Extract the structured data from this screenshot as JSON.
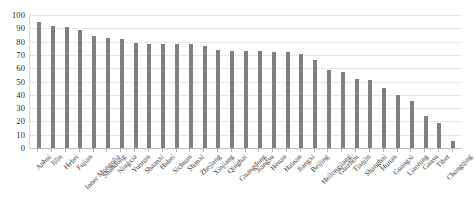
{
  "chart_data": {
    "type": "bar",
    "title": "",
    "subtitle": "",
    "xlabel": "",
    "ylabel": "",
    "ylim": [
      0,
      100
    ],
    "yticks": [
      100,
      90,
      80,
      70,
      60,
      50,
      40,
      30,
      20,
      10,
      0
    ],
    "grid": true,
    "legend": "none",
    "bar_color": "#808080",
    "gridline_color": "#e8e8e8",
    "axis_color": "#bfbfbf",
    "categories": [
      "Anhui",
      "Jilin",
      "Hebei",
      "Fujian",
      "Inner Mongolia",
      "Shandong",
      "Ningxia",
      "Yunnan",
      "Shaanxi",
      "Hubei",
      "Sichuan",
      "Shanxi",
      "Zhejiang",
      "Xinjiang",
      "Qinghai",
      "Guangdong",
      "Jiangsu",
      "Henan",
      "Hainan",
      "Jiangxi",
      "Beijing",
      "Heilongjiang",
      "Guizhou",
      "Tianjin",
      "Shanghai",
      "Hunan",
      "Guangxi",
      "Liaoning",
      "Gansu",
      "Tibet",
      "Chongqing"
    ],
    "values": [
      95,
      92,
      91,
      89,
      84,
      83,
      82,
      79,
      78,
      78,
      78,
      78,
      77,
      74,
      73,
      73,
      73,
      72,
      72,
      71,
      66,
      59,
      57,
      52,
      51,
      45,
      40,
      35,
      24,
      19,
      5
    ]
  }
}
